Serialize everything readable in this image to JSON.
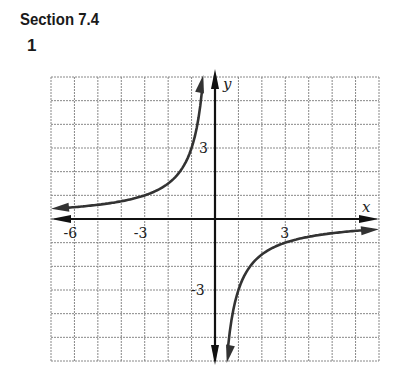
{
  "header": {
    "section": "Section 7.4",
    "problem_number": "1"
  },
  "chart_data": {
    "type": "line",
    "title": "",
    "xlabel": "x",
    "ylabel": "y",
    "xlim": [
      -7,
      7
    ],
    "ylim": [
      -6,
      6
    ],
    "grid": true,
    "x_ticks_labeled": [
      "-6",
      "-3",
      "3"
    ],
    "y_ticks_labeled": [
      "3",
      "-3"
    ],
    "function": "y = -3/x",
    "series": [
      {
        "name": "left branch",
        "x": [
          -7,
          -6,
          -5,
          -4,
          -3,
          -2,
          -1.5,
          -1,
          -0.75,
          -0.5
        ],
        "y": [
          0.43,
          0.5,
          0.6,
          0.75,
          1,
          1.5,
          2,
          3,
          4,
          6
        ]
      },
      {
        "name": "right branch",
        "x": [
          0.5,
          0.75,
          1,
          1.5,
          2,
          3,
          4,
          5,
          6,
          7
        ],
        "y": [
          -6,
          -4,
          -3,
          -2,
          -1.5,
          -1,
          -0.75,
          -0.6,
          -0.5,
          -0.43
        ]
      }
    ],
    "asymptotes": {
      "vertical": "x = 0",
      "horizontal": "y = 0"
    },
    "colors": {
      "curve": "#333333",
      "axis": "#111111",
      "grid": "#888888"
    }
  }
}
